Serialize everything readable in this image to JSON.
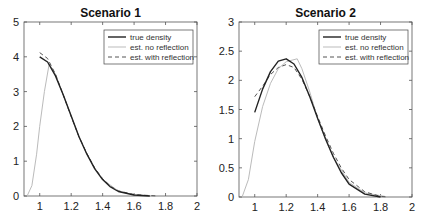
{
  "chart_data": [
    {
      "type": "line",
      "title": "Scenario 1",
      "xlabel": "",
      "ylabel": "",
      "xlim": [
        0.9,
        2
      ],
      "ylim": [
        0,
        5
      ],
      "xticks": [
        "1",
        "1.2",
        "1.4",
        "1.6",
        "1.8",
        "2"
      ],
      "yticks": [
        "0",
        "1",
        "2",
        "3",
        "4",
        "5"
      ],
      "grid": false,
      "legend_position": "upper right",
      "series": [
        {
          "name": "true density",
          "style": "solid dark",
          "x": [
            1.0,
            1.05,
            1.1,
            1.15,
            1.2,
            1.25,
            1.3,
            1.35,
            1.4,
            1.45,
            1.5,
            1.6,
            1.7
          ],
          "y": [
            4.0,
            3.85,
            3.45,
            2.9,
            2.3,
            1.7,
            1.2,
            0.78,
            0.47,
            0.26,
            0.13,
            0.03,
            0.0
          ]
        },
        {
          "name": "est. no reflection",
          "style": "solid light",
          "x": [
            0.92,
            0.95,
            0.98,
            1.0,
            1.03,
            1.06,
            1.1,
            1.15,
            1.2,
            1.25,
            1.3,
            1.35,
            1.4,
            1.5,
            1.6,
            1.75
          ],
          "y": [
            0.0,
            0.3,
            1.2,
            2.0,
            3.0,
            3.8,
            3.5,
            2.9,
            2.3,
            1.7,
            1.2,
            0.8,
            0.48,
            0.14,
            0.03,
            0.0
          ]
        },
        {
          "name": "est. with reflection",
          "style": "dashed",
          "x": [
            1.0,
            1.05,
            1.1,
            1.15,
            1.2,
            1.25,
            1.3,
            1.35,
            1.4,
            1.45,
            1.5,
            1.6,
            1.75
          ],
          "y": [
            4.12,
            3.95,
            3.5,
            2.9,
            2.28,
            1.7,
            1.22,
            0.8,
            0.5,
            0.28,
            0.15,
            0.04,
            0.0
          ]
        }
      ]
    },
    {
      "type": "line",
      "title": "Scenario 2",
      "xlabel": "",
      "ylabel": "",
      "xlim": [
        0.9,
        2
      ],
      "ylim": [
        0,
        3
      ],
      "xticks": [
        "1",
        "1.2",
        "1.4",
        "1.6",
        "1.8",
        "2"
      ],
      "yticks": [
        "0",
        "0.5",
        "1",
        "1.5",
        "2",
        "2.5",
        "3"
      ],
      "grid": false,
      "legend_position": "upper right",
      "series": [
        {
          "name": "true density",
          "style": "solid dark",
          "x": [
            1.0,
            1.05,
            1.1,
            1.15,
            1.2,
            1.25,
            1.3,
            1.35,
            1.4,
            1.45,
            1.5,
            1.55,
            1.6,
            1.7,
            1.8
          ],
          "y": [
            1.45,
            1.85,
            2.15,
            2.33,
            2.37,
            2.28,
            2.05,
            1.72,
            1.35,
            1.0,
            0.68,
            0.42,
            0.22,
            0.05,
            0.0
          ]
        },
        {
          "name": "est. no reflection",
          "style": "solid light",
          "x": [
            0.92,
            0.96,
            1.0,
            1.05,
            1.1,
            1.15,
            1.2,
            1.27,
            1.3,
            1.35,
            1.4,
            1.45,
            1.5,
            1.6,
            1.7,
            1.85
          ],
          "y": [
            0.0,
            0.3,
            0.95,
            1.55,
            1.95,
            2.2,
            2.32,
            2.37,
            2.2,
            1.8,
            1.35,
            0.98,
            0.68,
            0.25,
            0.07,
            0.0
          ]
        },
        {
          "name": "est. with reflection",
          "style": "dashed",
          "x": [
            1.0,
            1.05,
            1.1,
            1.15,
            1.2,
            1.25,
            1.3,
            1.35,
            1.4,
            1.45,
            1.5,
            1.55,
            1.6,
            1.7,
            1.8,
            1.85
          ],
          "y": [
            1.72,
            1.9,
            2.1,
            2.22,
            2.27,
            2.22,
            2.02,
            1.72,
            1.38,
            1.05,
            0.75,
            0.5,
            0.3,
            0.09,
            0.01,
            0.0
          ]
        }
      ]
    }
  ]
}
